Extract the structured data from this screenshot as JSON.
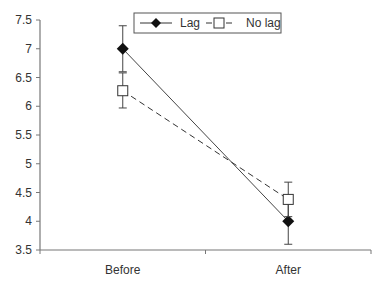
{
  "chart_data": {
    "type": "line",
    "title": "",
    "xlabel": "",
    "ylabel": "",
    "categories": [
      "Before",
      "After"
    ],
    "ylim": [
      3.5,
      7.5
    ],
    "yticks": [
      "3.5",
      "4",
      "4.5",
      "5",
      "5.5",
      "6",
      "6.5",
      "7",
      "7.5"
    ],
    "grid": false,
    "legend_position": "top-center",
    "series": [
      {
        "name": "Lag",
        "marker": "filled-diamond",
        "line": "solid",
        "values": [
          7.0,
          4.0
        ],
        "error_low": [
          6.6,
          3.6
        ],
        "error_high": [
          7.4,
          4.4
        ]
      },
      {
        "name": "No lag",
        "marker": "open-square",
        "line": "dashed",
        "values": [
          6.27,
          4.38
        ],
        "error_low": [
          5.97,
          4.08
        ],
        "error_high": [
          6.58,
          4.68
        ]
      }
    ]
  }
}
